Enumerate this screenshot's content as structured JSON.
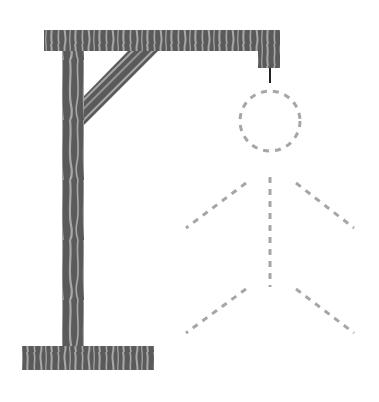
{
  "game": {
    "name": "hangman",
    "wrong_guesses_shown": 0,
    "figure_state": "outline-only"
  },
  "colors": {
    "background": "#ffffff",
    "wood_dark": "#5a5a5a",
    "wood_light": "#a8a8a8",
    "rope": "#222222",
    "figure_dashed": "#a6a6a6"
  },
  "gallows": {
    "parts": [
      "top-beam",
      "vertical-post",
      "diagonal-brace",
      "base",
      "hanging-block",
      "rope"
    ]
  },
  "figure": {
    "parts": [
      "head",
      "body",
      "left-arm",
      "right-arm",
      "left-leg",
      "right-leg"
    ],
    "style": "dashed"
  }
}
